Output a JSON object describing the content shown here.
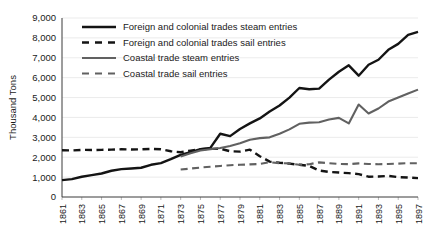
{
  "chart_data": {
    "type": "line",
    "title": "",
    "xlabel": "",
    "ylabel": "Thousand Tons",
    "ylim": [
      0,
      9000
    ],
    "ytick_values": [
      0,
      1000,
      2000,
      3000,
      4000,
      5000,
      6000,
      7000,
      8000,
      9000
    ],
    "ytick_labels": [
      "0",
      "1,000",
      "2,000",
      "3,000",
      "4,000",
      "5,000",
      "6,000",
      "7,000",
      "8,000",
      "9,000"
    ],
    "xlim": [
      1861,
      1897
    ],
    "x": [
      1861,
      1862,
      1863,
      1864,
      1865,
      1866,
      1867,
      1868,
      1869,
      1870,
      1871,
      1872,
      1873,
      1874,
      1875,
      1876,
      1877,
      1878,
      1879,
      1880,
      1881,
      1882,
      1883,
      1884,
      1885,
      1886,
      1887,
      1888,
      1889,
      1890,
      1891,
      1892,
      1893,
      1894,
      1895,
      1896,
      1897
    ],
    "xtick_labels": [
      "1861",
      "1863",
      "1865",
      "1867",
      "1869",
      "1871",
      "1873",
      "1875",
      "1877",
      "1879",
      "1881",
      "1883",
      "1885",
      "1887",
      "1889",
      "1891",
      "1893",
      "1895",
      "1897"
    ],
    "grid": true,
    "legend_position": "upper-left-inside",
    "series": [
      {
        "name": "Foreign and colonial trades steam entries",
        "style": "solid",
        "color": "#141414",
        "width": 2.4,
        "x": [
          1861,
          1862,
          1863,
          1864,
          1865,
          1866,
          1867,
          1868,
          1869,
          1870,
          1871,
          1872,
          1873,
          1874,
          1875,
          1876,
          1877,
          1878,
          1879,
          1880,
          1881,
          1882,
          1883,
          1884,
          1885,
          1886,
          1887,
          1888,
          1889,
          1890,
          1891,
          1892,
          1893,
          1894,
          1895,
          1896,
          1897
        ],
        "values": [
          850,
          900,
          1020,
          1100,
          1180,
          1320,
          1400,
          1430,
          1470,
          1620,
          1700,
          1900,
          2120,
          2250,
          2400,
          2470,
          3180,
          3060,
          3420,
          3700,
          3950,
          4300,
          4600,
          5000,
          5480,
          5420,
          5450,
          5900,
          6300,
          6620,
          6100,
          6650,
          6900,
          7400,
          7700,
          8150,
          8300
        ]
      },
      {
        "name": "Foreign and colonial trades sail entries",
        "style": "dashed",
        "color": "#141414",
        "width": 2.4,
        "x": [
          1861,
          1862,
          1863,
          1864,
          1865,
          1866,
          1867,
          1868,
          1869,
          1870,
          1871,
          1872,
          1873,
          1874,
          1875,
          1876,
          1877,
          1878,
          1879,
          1880,
          1881,
          1882,
          1883,
          1884,
          1885,
          1886,
          1887,
          1888,
          1889,
          1890,
          1891,
          1892,
          1893,
          1894,
          1895,
          1896,
          1897
        ],
        "values": [
          2350,
          2340,
          2370,
          2360,
          2370,
          2380,
          2400,
          2390,
          2400,
          2420,
          2400,
          2300,
          2250,
          2330,
          2400,
          2420,
          2430,
          2300,
          2280,
          2380,
          2050,
          1780,
          1720,
          1680,
          1620,
          1560,
          1330,
          1260,
          1230,
          1200,
          1150,
          1020,
          1030,
          1060,
          1000,
          980,
          950
        ]
      },
      {
        "name": "Coastal trade steam entries",
        "style": "solid",
        "color": "#616161",
        "width": 2.1,
        "x": [
          1873,
          1874,
          1875,
          1876,
          1877,
          1878,
          1879,
          1880,
          1881,
          1882,
          1883,
          1884,
          1885,
          1886,
          1887,
          1888,
          1889,
          1890,
          1891,
          1892,
          1893,
          1894,
          1895,
          1896,
          1897
        ],
        "values": [
          2030,
          2200,
          2340,
          2400,
          2460,
          2560,
          2700,
          2880,
          2960,
          3000,
          3180,
          3400,
          3680,
          3740,
          3760,
          3900,
          3980,
          3700,
          4650,
          4200,
          4450,
          4800,
          5000,
          5200,
          5400
        ]
      },
      {
        "name": "Coastal trade sail entries",
        "style": "dashed",
        "color": "#616161",
        "width": 2.1,
        "x": [
          1873,
          1874,
          1875,
          1876,
          1877,
          1878,
          1879,
          1880,
          1881,
          1882,
          1883,
          1884,
          1885,
          1886,
          1887,
          1888,
          1889,
          1890,
          1891,
          1892,
          1893,
          1894,
          1895,
          1896,
          1897
        ],
        "values": [
          1380,
          1430,
          1480,
          1520,
          1560,
          1600,
          1620,
          1640,
          1660,
          1750,
          1700,
          1690,
          1620,
          1650,
          1740,
          1700,
          1660,
          1650,
          1690,
          1660,
          1650,
          1660,
          1680,
          1700,
          1700
        ]
      }
    ]
  }
}
